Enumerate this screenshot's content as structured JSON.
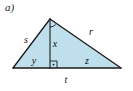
{
  "figure": {
    "part_label": "a)",
    "type": "geometry-diagram",
    "shape": "triangle-with-altitude",
    "colors": {
      "fill": "#bfdfec",
      "stroke": "#1a1a1a",
      "text": "#111111",
      "background": "#ffffff"
    },
    "vertices": {
      "apex": {
        "x": 50,
        "y": 19
      },
      "left": {
        "x": 13,
        "y": 68
      },
      "right": {
        "x": 121,
        "y": 68
      },
      "foot": {
        "x": 50,
        "y": 68
      }
    },
    "labels": {
      "left_side": "s",
      "right_side": "r",
      "altitude": "x",
      "base_left_segment": "y",
      "base_right_segment": "z",
      "base_full": "t"
    },
    "label_positions": {
      "left_side": {
        "x": 26,
        "y": 43
      },
      "right_side": {
        "x": 91,
        "y": 35
      },
      "altitude": {
        "x": 55,
        "y": 47
      },
      "base_left_segment": {
        "x": 34,
        "y": 64
      },
      "base_right_segment": {
        "x": 87,
        "y": 64
      },
      "base_full": {
        "x": 66,
        "y": 82
      }
    },
    "markers": {
      "apex_angle_arc": "angle-arc",
      "foot_right_angle": "right-angle-square-with-dot"
    }
  }
}
